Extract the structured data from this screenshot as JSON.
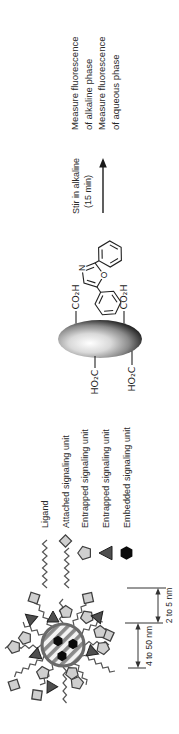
{
  "figure": {
    "legend": {
      "items": [
        {
          "icon": "zigzag-line",
          "label": "Ligand"
        },
        {
          "icon": "zigzag-with-diamond",
          "label": "Attached signaling unit"
        },
        {
          "icon": "pentagon",
          "label": "Entrapped signaling unit"
        },
        {
          "icon": "triangle",
          "label": "Entrapped signaling unit"
        },
        {
          "icon": "black-hexagon",
          "label": "Embedded signaling unit"
        }
      ]
    },
    "dimensions": {
      "core": "4 to 50 nm",
      "shell": "2 to 5 nm"
    },
    "particle_surface_groups": {
      "right_top": "CO₂H",
      "right_bottom": "CO₂H",
      "left_top": "HO₂C",
      "left_bottom": "HO₂C"
    },
    "molecule": {
      "n_label": "N",
      "o_label": "O"
    },
    "process": {
      "step_label_line1": "Stir in alkaline",
      "step_label_line2": "(15 min)",
      "result_line1": "Measure fluorescence",
      "result_line2": "of alkaline phase",
      "result_line3": "Measure fluorescence",
      "result_line4": "of aqueous phase"
    },
    "colors": {
      "background": "#ffffff",
      "ink": "#222222",
      "shape_fill": "#cfcfcf",
      "shape_stroke": "#3f3f3f",
      "triangle_fill": "#4f4f4f",
      "stripe_gray": "#8a8a8a"
    }
  }
}
